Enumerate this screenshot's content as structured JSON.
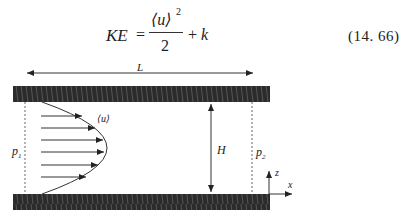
{
  "equation": {
    "lhs": "KE",
    "equals": "=",
    "numerator": "⟨u⟩",
    "numerator_power": "2",
    "denominator": "2",
    "plus": "+",
    "rhs_term": "k",
    "number": "(14. 66)"
  },
  "figure": {
    "labels": {
      "length": "L",
      "height": "H",
      "mean_velocity": "⟨u⟩",
      "pressure_inlet": "p",
      "pressure_inlet_sub": "1",
      "pressure_outlet": "p",
      "pressure_outlet_sub": "2",
      "axis_z": "z",
      "axis_x": "x"
    },
    "colors": {
      "wall": "#2b2b2b",
      "line": "#333333",
      "dotted": "#666666"
    }
  }
}
